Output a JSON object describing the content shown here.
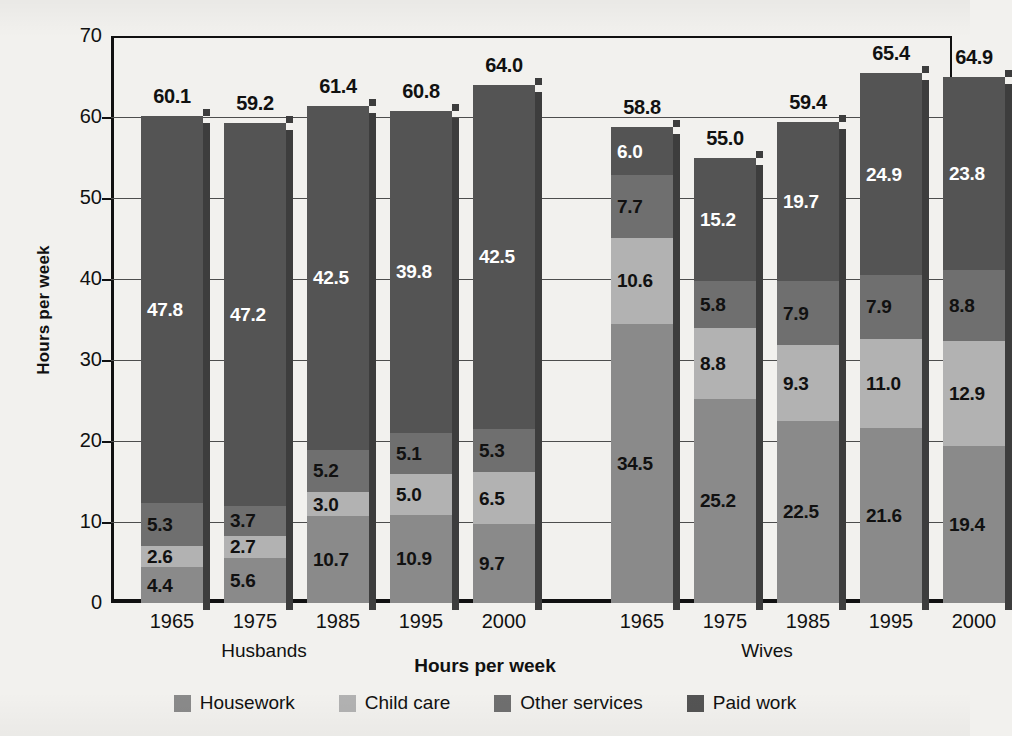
{
  "chart_data": {
    "type": "bar",
    "subtype": "stacked-bar-grouped",
    "title": "",
    "xlabel": "Hours per week",
    "ylabel": "Hours per week",
    "ylim": [
      0,
      70
    ],
    "ytick_values": [
      0,
      10,
      20,
      30,
      40,
      50,
      60,
      70
    ],
    "ytick_labels": [
      "0",
      "10",
      "20",
      "30",
      "40",
      "50",
      "60",
      "70"
    ],
    "grid": true,
    "legend_position": "bottom",
    "stack_order_bottom_to_top": [
      "Housework",
      "Child care",
      "Other services",
      "Paid work"
    ],
    "groups": [
      "Husbands",
      "Wives"
    ],
    "categories": [
      "1965",
      "1975",
      "1985",
      "1995",
      "2000"
    ],
    "series": [
      {
        "name": "Housework",
        "color": "#8a8a8a",
        "values_husbands": [
          4.4,
          5.6,
          10.7,
          10.9,
          9.7
        ],
        "values_wives": [
          34.5,
          25.2,
          22.5,
          21.6,
          19.4
        ]
      },
      {
        "name": "Child care",
        "color": "#b2b2b2",
        "values_husbands": [
          2.6,
          2.7,
          3.0,
          5.0,
          6.5
        ],
        "values_wives": [
          10.6,
          8.8,
          9.3,
          11.0,
          12.9
        ]
      },
      {
        "name": "Other services",
        "color": "#6f6f6f",
        "values_husbands": [
          5.3,
          3.7,
          5.2,
          5.1,
          5.3
        ],
        "values_wives": [
          7.7,
          5.8,
          7.9,
          7.9,
          8.8
        ]
      },
      {
        "name": "Paid work",
        "color": "#545454",
        "values_husbands": [
          47.8,
          47.2,
          42.5,
          39.8,
          42.5
        ],
        "values_wives": [
          6.0,
          15.2,
          19.7,
          24.9,
          23.8
        ]
      }
    ],
    "totals_husbands": [
      60.1,
      59.2,
      61.4,
      60.8,
      64.0
    ],
    "totals_wives": [
      58.8,
      55.0,
      59.4,
      65.4,
      64.9
    ]
  },
  "axes": {
    "y_title": "Hours per week",
    "x_title": "Hours per week",
    "y_ticks": [
      "70",
      "60",
      "50",
      "40",
      "30",
      "20",
      "10",
      "0"
    ],
    "group_husbands": "Husbands",
    "group_wives": "Wives",
    "x_ticks": [
      "1965",
      "1975",
      "1985",
      "1995",
      "2000"
    ]
  },
  "legend": {
    "items": [
      {
        "label": "Housework",
        "color": "#8a8a8a"
      },
      {
        "label": "Child care",
        "color": "#b2b2b2"
      },
      {
        "label": "Other services",
        "color": "#6f6f6f"
      },
      {
        "label": "Paid work",
        "color": "#545454"
      }
    ]
  },
  "labels": {
    "husbands": {
      "totals": [
        "60.1",
        "59.2",
        "61.4",
        "60.8",
        "64.0"
      ],
      "paid_work": [
        "47.8",
        "47.2",
        "42.5",
        "39.8",
        "42.5"
      ],
      "other_services": [
        "5.3",
        "3.7",
        "5.2",
        "5.1",
        "5.3"
      ],
      "child_care": [
        "2.6",
        "2.7",
        "3.0",
        "5.0",
        "6.5"
      ],
      "housework": [
        "4.4",
        "5.6",
        "10.7",
        "10.9",
        "9.7"
      ]
    },
    "wives": {
      "totals": [
        "58.8",
        "55.0",
        "59.4",
        "65.4",
        "64.9"
      ],
      "paid_work": [
        "6.0",
        "15.2",
        "19.7",
        "24.9",
        "23.8"
      ],
      "other_services": [
        "7.7",
        "5.8",
        "7.9",
        "7.9",
        "8.8"
      ],
      "child_care": [
        "10.6",
        "8.8",
        "9.3",
        "11.0",
        "12.9"
      ],
      "housework": [
        "34.5",
        "25.2",
        "22.5",
        "21.6",
        "19.4"
      ]
    }
  }
}
